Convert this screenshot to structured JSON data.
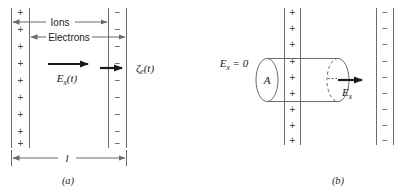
{
  "figure": {
    "panels": [
      {
        "id": "a",
        "caption": "(a)",
        "left_plate": {
          "name": "positive-charge-sheet",
          "symbol": "+",
          "count": 9
        },
        "right_plate": {
          "name": "negative-charge-sheet",
          "symbol": "−",
          "count": 9
        },
        "annotations": [
          {
            "name": "ions-arrow-label",
            "text": "Ions"
          },
          {
            "name": "electrons-arrow-label",
            "text": "Electrons"
          },
          {
            "name": "field-arrow-label",
            "base": "E",
            "sub": "x",
            "suffix": "(t)"
          },
          {
            "name": "displacement-label",
            "base": "ζ",
            "sub": "e",
            "suffix": "(t)"
          },
          {
            "name": "length-dimension-label",
            "text": "l"
          }
        ]
      },
      {
        "id": "b",
        "caption": "(b)",
        "left_plate": {
          "name": "positive-charge-sheet",
          "symbol": "+",
          "count": 9
        },
        "right_plate": {
          "name": "negative-charge-sheet",
          "symbol": "−",
          "count": 9
        },
        "gaussian_cylinder": {
          "name": "gaussian-surface-cylinder",
          "area_label": "A",
          "left_face": "solid-ellipse",
          "right_face": "dashed-ellipse",
          "dots": "⋯"
        },
        "annotations": [
          {
            "name": "zero-field-label",
            "base": "E",
            "sub": "x",
            "suffix": " = 0"
          },
          {
            "name": "exit-field-label",
            "base": "E",
            "sub": "x",
            "suffix": ""
          }
        ]
      }
    ]
  },
  "colors": {
    "line": "#6b6b6b",
    "arrow_dark": "#1a1a1a",
    "text": "#1a1a1a",
    "charge": "#4a4a4a",
    "background": "#ffffff"
  }
}
